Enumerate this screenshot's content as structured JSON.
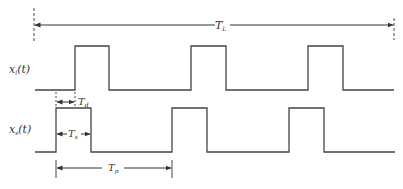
{
  "diagram": {
    "type": "timing-diagram",
    "labels": {
      "top_signal": "x(t)",
      "top_signal_sub": "l",
      "bottom_signal": "x(t)",
      "bottom_signal_sub": "s",
      "total_length": "T",
      "total_length_sub": "L",
      "delay": "T",
      "delay_sub": "d",
      "pulse_width": "T",
      "pulse_width_sub": "s",
      "period": "T",
      "period_sub": "p"
    },
    "colors": {
      "line": "#444444",
      "background": "#ffffff"
    },
    "signals": [
      {
        "name": "x_l(t)",
        "pulses": [
          {
            "rise_x": 75,
            "fall_x": 109
          },
          {
            "rise_x": 191,
            "fall_x": 226
          },
          {
            "rise_x": 308,
            "fall_x": 343
          }
        ]
      },
      {
        "name": "x_s(t)",
        "pulses": [
          {
            "rise_x": 56,
            "fall_x": 91
          },
          {
            "rise_x": 172,
            "fall_x": 207
          },
          {
            "rise_x": 289,
            "fall_x": 324
          }
        ]
      }
    ]
  }
}
